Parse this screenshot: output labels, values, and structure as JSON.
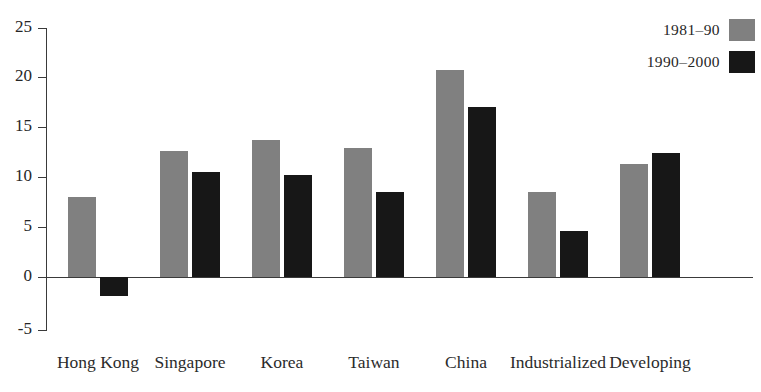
{
  "chart_data": {
    "type": "bar",
    "title": "",
    "xlabel": "",
    "ylabel": "",
    "grid": false,
    "legend_position": "top-right",
    "ylim": [
      -5,
      25
    ],
    "yticks": [
      25,
      20,
      15,
      10,
      5,
      0,
      -5
    ],
    "ytick_labels": [
      "25",
      "20",
      "15",
      "10",
      "5",
      "0",
      "-5"
    ],
    "categories": [
      "Hong Kong",
      "Singapore",
      "Korea",
      "Taiwan",
      "China",
      "Industrialized",
      "Developing"
    ],
    "series": [
      {
        "name": "1981-90",
        "color": "#808080",
        "values": [
          8.0,
          12.6,
          13.7,
          12.9,
          20.7,
          8.5,
          11.3
        ]
      },
      {
        "name": "1990-2000",
        "color": "#171717",
        "values": [
          -1.9,
          10.5,
          10.2,
          8.5,
          17.0,
          4.6,
          12.4
        ]
      }
    ]
  },
  "axis": {
    "ytick_0": "25",
    "ytick_1": "20",
    "ytick_2": "15",
    "ytick_3": "10",
    "ytick_4": "5",
    "ytick_5": "0",
    "ytick_6": "-5"
  },
  "legend": {
    "rows": [
      {
        "label": "1981–90",
        "swatch": "#808080"
      },
      {
        "label": "1990–2000",
        "swatch": "#171717"
      }
    ]
  }
}
